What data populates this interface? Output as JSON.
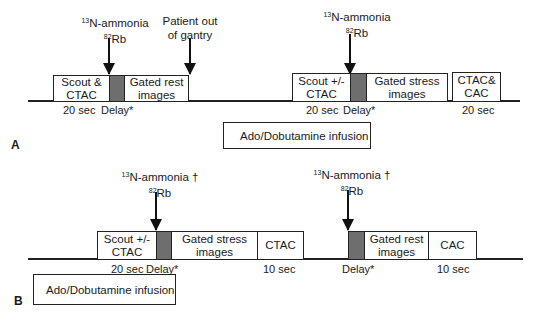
{
  "panelA": {
    "letter": "A",
    "tracer1": {
      "line1_sup": "13",
      "line1": "N-ammonia",
      "line2_sup": "82",
      "line2": "Rb"
    },
    "patient_out": {
      "line1": "Patient out",
      "line2": "of gantry"
    },
    "tracer2": {
      "line1_sup": "13",
      "line1": "N-ammonia",
      "line2_sup": "82",
      "line2": "Rb"
    },
    "boxes": {
      "scout_ctac": "Scout &\nCTAC",
      "gated_rest": "Gated rest\nimages",
      "scout_pm_ctac": "Scout +/-\nCTAC",
      "gated_stress": "Gated stress\nimages",
      "ctac_cac": "CTAC&\nCAC"
    },
    "labels": {
      "t1": "20 sec",
      "d1": "Delay*",
      "t2": "20 sec",
      "d2": "Delay*",
      "t3": "20 sec"
    },
    "infusion": "Ado/Dobutamine infusion"
  },
  "panelB": {
    "letter": "B",
    "tracer1": {
      "line1_sup": "13",
      "line1": "N-ammonia †",
      "line2_sup": "82",
      "line2": "Rb"
    },
    "tracer2": {
      "line1_sup": "13",
      "line1": "N-ammonia †",
      "line2_sup": "82",
      "line2": "Rb"
    },
    "boxes": {
      "scout_pm_ctac": "Scout +/-\nCTAC",
      "gated_stress": "Gated stress\nimages",
      "ctac": "CTAC",
      "gated_rest": "Gated rest\nimages",
      "cac": "CAC"
    },
    "labels": {
      "t1": "20 sec",
      "d1": "Delay*",
      "t2": "10 sec",
      "d2": "Delay*",
      "t3": "10 sec"
    },
    "infusion": "Ado/Dobutamine infusion"
  },
  "colors": {
    "delay_fill": "#6e6e6e",
    "stroke": "#222222"
  }
}
